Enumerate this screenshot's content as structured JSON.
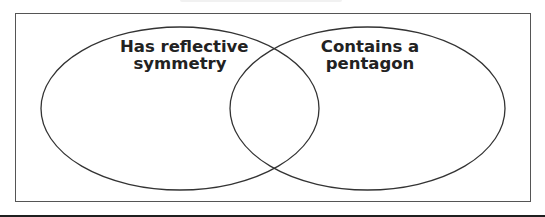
{
  "diagram": {
    "type": "venn",
    "sets": [
      {
        "id": "left",
        "label_line1": "Has reflective",
        "label_line2": "symmetry"
      },
      {
        "id": "right",
        "label_line1": "Contains a",
        "label_line2": "pentagon"
      }
    ],
    "colors": {
      "stroke": "#333333",
      "frame": "#555555",
      "text": "#222222",
      "background": "#ffffff"
    }
  }
}
